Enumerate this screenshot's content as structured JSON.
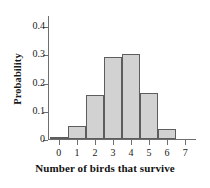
{
  "chart_data": {
    "type": "bar",
    "title": "",
    "subtitle": "",
    "xlabel": "Number of birds that survive",
    "ylabel": "Probability",
    "categories": [
      "0",
      "1",
      "2",
      "3",
      "4",
      "5",
      "6",
      "7"
    ],
    "values": [
      0.005,
      0.045,
      0.157,
      0.29,
      0.3,
      0.163,
      0.034,
      0.0
    ],
    "xlim": [
      -0.6,
      7.6
    ],
    "ylim": [
      0,
      0.44
    ],
    "xticks": [
      "0",
      "1",
      "2",
      "3",
      "4",
      "5",
      "6",
      "7"
    ],
    "yticks": [
      "0",
      "0.1",
      "0.2",
      "0.3",
      "0.4"
    ],
    "ytick_values": [
      0,
      0.1,
      0.2,
      0.3,
      0.4
    ],
    "grid": false,
    "legend": false,
    "legend_position": "none",
    "bar_width": 1,
    "bar_fill_color": "#d2d2d2",
    "bar_edge_color": "#5d5d5d",
    "axis_color": "#6e6e6e",
    "background_color": "#ffffff",
    "text_color": "#1a1a1a"
  }
}
